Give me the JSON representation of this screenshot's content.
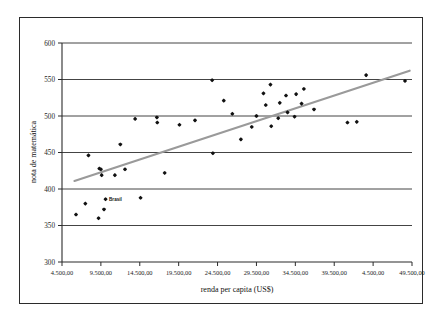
{
  "chart_data": {
    "type": "scatter",
    "title": "",
    "xlabel": "renda per capita (US$)",
    "ylabel": "nota de matemática",
    "xlim": [
      4500,
      49500
    ],
    "ylim": [
      300,
      600
    ],
    "grid": true,
    "legend": false,
    "x_tick_labels": [
      "4.500,00",
      "9.500,00",
      "14.500,00",
      "19.500,00",
      "24.500,00",
      "29.500,00",
      "34.500,00",
      "39.500,00",
      "4.500,00",
      "49.500,00"
    ],
    "x_tick_values": [
      4500,
      9500,
      14500,
      19500,
      24500,
      29500,
      34500,
      39500,
      44500,
      49500
    ],
    "y_tick_labels": [
      "300",
      "350",
      "400",
      "450",
      "500",
      "550",
      "600"
    ],
    "y_tick_values": [
      300,
      350,
      400,
      450,
      500,
      550,
      600
    ],
    "annotations": [
      {
        "label": "Brasil",
        "x": 10100,
        "y": 386
      }
    ],
    "series": [
      {
        "name": "países",
        "marker": "diamond",
        "color": "#111111",
        "points": [
          {
            "x": 6300,
            "y": 365
          },
          {
            "x": 7500,
            "y": 380
          },
          {
            "x": 7900,
            "y": 446
          },
          {
            "x": 9200,
            "y": 360
          },
          {
            "x": 9300,
            "y": 428
          },
          {
            "x": 9500,
            "y": 427
          },
          {
            "x": 9600,
            "y": 419
          },
          {
            "x": 9900,
            "y": 372
          },
          {
            "x": 10100,
            "y": 386
          },
          {
            "x": 11300,
            "y": 419
          },
          {
            "x": 12000,
            "y": 461
          },
          {
            "x": 12600,
            "y": 427
          },
          {
            "x": 13900,
            "y": 496
          },
          {
            "x": 14600,
            "y": 388
          },
          {
            "x": 16700,
            "y": 498
          },
          {
            "x": 16750,
            "y": 491
          },
          {
            "x": 17700,
            "y": 422
          },
          {
            "x": 19600,
            "y": 488
          },
          {
            "x": 21600,
            "y": 494
          },
          {
            "x": 23800,
            "y": 549
          },
          {
            "x": 23900,
            "y": 449
          },
          {
            "x": 25300,
            "y": 521
          },
          {
            "x": 26400,
            "y": 503
          },
          {
            "x": 27500,
            "y": 468
          },
          {
            "x": 28900,
            "y": 485
          },
          {
            "x": 29500,
            "y": 500
          },
          {
            "x": 30400,
            "y": 531
          },
          {
            "x": 30700,
            "y": 515
          },
          {
            "x": 31300,
            "y": 543
          },
          {
            "x": 31400,
            "y": 486
          },
          {
            "x": 32300,
            "y": 497
          },
          {
            "x": 32500,
            "y": 518
          },
          {
            "x": 33300,
            "y": 528
          },
          {
            "x": 33500,
            "y": 505
          },
          {
            "x": 34400,
            "y": 499
          },
          {
            "x": 34600,
            "y": 530
          },
          {
            "x": 35300,
            "y": 517
          },
          {
            "x": 35600,
            "y": 537
          },
          {
            "x": 36900,
            "y": 509
          },
          {
            "x": 41200,
            "y": 491
          },
          {
            "x": 42400,
            "y": 492
          },
          {
            "x": 43600,
            "y": 556
          },
          {
            "x": 48600,
            "y": 548
          }
        ]
      }
    ],
    "trendline": {
      "name": "linha de tendência",
      "color": "#9a9a9a",
      "x_start": 6100,
      "y_start": 411,
      "x_end": 49200,
      "y_end": 562
    }
  },
  "axis": {
    "x_title": "renda per capita (US$)",
    "y_title": "nota de matemática"
  }
}
